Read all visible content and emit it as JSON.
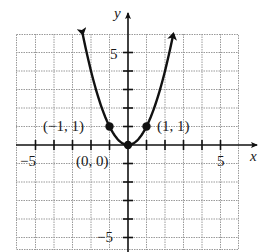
{
  "chart_data": {
    "type": "line",
    "title": "",
    "function": "y = x^2",
    "xlabel": "x",
    "ylabel": "y",
    "xlim": [
      -6,
      6
    ],
    "ylim": [
      -5.7,
      6
    ],
    "grid": true,
    "legend": null,
    "x_tick_labels": [
      {
        "value": -5,
        "label": "−5"
      },
      {
        "value": 5,
        "label": "5"
      }
    ],
    "y_tick_labels": [
      {
        "value": 5,
        "label": "5"
      },
      {
        "value": -5,
        "label": "−5"
      }
    ],
    "series": [
      {
        "name": "parabola",
        "x": [
          -2.45,
          -2,
          -1.5,
          -1,
          -0.5,
          0,
          0.5,
          1,
          1.5,
          2,
          2.45
        ],
        "y": [
          6.0,
          4,
          2.25,
          1,
          0.25,
          0,
          0.25,
          1,
          2.25,
          4,
          6.0
        ],
        "arrows_at_ends": true
      }
    ],
    "points": [
      {
        "x": -1,
        "y": 1,
        "label": "(−1, 1)"
      },
      {
        "x": 0,
        "y": 0,
        "label": "(0, 0)"
      },
      {
        "x": 1,
        "y": 1,
        "label": "(1, 1)"
      }
    ],
    "colors": {
      "curve": "#111111",
      "axes": "#111111",
      "grid": "#9a9a9a",
      "background": "#ffffff"
    }
  }
}
